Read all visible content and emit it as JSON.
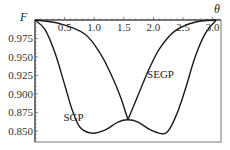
{
  "chart_data": {
    "type": "line",
    "title": "",
    "xlabel": "θ",
    "ylabel": "F",
    "xlim": [
      0,
      3.1416
    ],
    "ylim": [
      0.835,
      1.0
    ],
    "x_ticks": [
      0.5,
      1.0,
      1.5,
      2.0,
      2.5,
      3.0
    ],
    "x_tick_labels": [
      "0.5",
      "1.0",
      "1.5",
      "2.0",
      "2.5",
      "3.0"
    ],
    "y_ticks": [
      0.975,
      0.95,
      0.925,
      0.9,
      0.875,
      0.85
    ],
    "y_tick_labels": [
      "0.975",
      "0.950",
      "0.925",
      "0.900",
      "0.875",
      "0.850"
    ],
    "grid": false,
    "legend": "none",
    "series": [
      {
        "name": "SGP",
        "label_at": [
          0.65,
          0.863
        ],
        "x": [
          0,
          0.17,
          0.34,
          0.51,
          0.63,
          0.76,
          0.96,
          1.18,
          1.4,
          1.57,
          1.74,
          1.96,
          2.21,
          2.38,
          2.53,
          2.7,
          2.87,
          3.06
        ],
        "y": [
          1.0,
          0.987,
          0.955,
          0.91,
          0.878,
          0.855,
          0.847,
          0.851,
          0.862,
          0.865,
          0.862,
          0.851,
          0.847,
          0.87,
          0.904,
          0.949,
          0.981,
          1.0
        ]
      },
      {
        "name": "SEGP",
        "label_at": [
          2.12,
          0.921
        ],
        "x": [
          0,
          0.42,
          0.84,
          1.1,
          1.27,
          1.44,
          1.57,
          1.77,
          1.94,
          2.11,
          2.36,
          2.7,
          3.06
        ],
        "y": [
          1.0,
          0.995,
          0.981,
          0.955,
          0.929,
          0.897,
          0.865,
          0.904,
          0.936,
          0.962,
          0.985,
          0.997,
          1.0
        ]
      }
    ]
  }
}
